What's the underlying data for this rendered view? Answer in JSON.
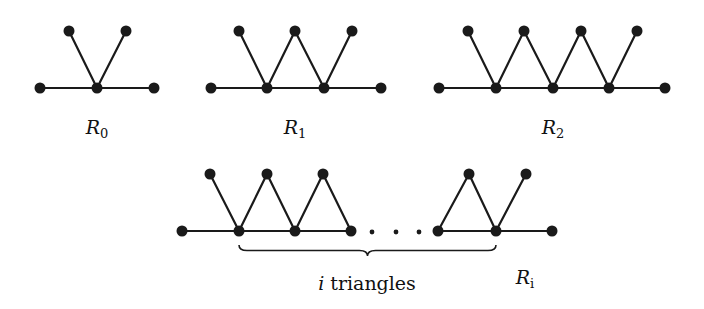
{
  "figure": {
    "graphs": [
      {
        "id": "R0",
        "label": "R",
        "subscript": "0",
        "label_pos": [
          97,
          134
        ],
        "top_nodes": [
          [
            69,
            31
          ],
          [
            126,
            31
          ]
        ],
        "bottom_nodes": [
          [
            40,
            88
          ],
          [
            97,
            88
          ],
          [
            154,
            88
          ]
        ],
        "edges": [
          [
            [
              40,
              88
            ],
            [
              154,
              88
            ]
          ],
          [
            [
              69,
              31
            ],
            [
              97,
              88
            ]
          ],
          [
            [
              126,
              31
            ],
            [
              97,
              88
            ]
          ]
        ]
      },
      {
        "id": "R1",
        "label": "R",
        "subscript": "1",
        "label_pos": [
          295,
          134
        ],
        "top_nodes": [
          [
            239,
            31
          ],
          [
            295,
            31
          ],
          [
            352,
            31
          ]
        ],
        "bottom_nodes": [
          [
            211,
            88
          ],
          [
            267,
            88
          ],
          [
            324,
            88
          ],
          [
            381,
            88
          ]
        ],
        "edges": [
          [
            [
              211,
              88
            ],
            [
              381,
              88
            ]
          ],
          [
            [
              239,
              31
            ],
            [
              267,
              88
            ]
          ],
          [
            [
              267,
              88
            ],
            [
              295,
              31
            ]
          ],
          [
            [
              295,
              31
            ],
            [
              324,
              88
            ]
          ],
          [
            [
              324,
              88
            ],
            [
              352,
              31
            ]
          ]
        ]
      },
      {
        "id": "R2",
        "label": "R",
        "subscript": "2",
        "label_pos": [
          553,
          134
        ],
        "top_nodes": [
          [
            468,
            31
          ],
          [
            524,
            31
          ],
          [
            581,
            31
          ],
          [
            637,
            31
          ]
        ],
        "bottom_nodes": [
          [
            439,
            88
          ],
          [
            496,
            88
          ],
          [
            553,
            88
          ],
          [
            609,
            88
          ],
          [
            665,
            88
          ]
        ],
        "edges": [
          [
            [
              439,
              88
            ],
            [
              665,
              88
            ]
          ],
          [
            [
              468,
              31
            ],
            [
              496,
              88
            ]
          ],
          [
            [
              496,
              88
            ],
            [
              524,
              31
            ]
          ],
          [
            [
              524,
              31
            ],
            [
              553,
              88
            ]
          ],
          [
            [
              553,
              88
            ],
            [
              581,
              31
            ]
          ],
          [
            [
              581,
              31
            ],
            [
              609,
              88
            ]
          ],
          [
            [
              609,
              88
            ],
            [
              637,
              31
            ]
          ]
        ]
      },
      {
        "id": "Ri",
        "label": "R",
        "subscript": "i",
        "label_pos": [
          525,
          284
        ],
        "top_nodes": [
          [
            210,
            174
          ],
          [
            267,
            174
          ],
          [
            323,
            174
          ],
          [
            469,
            174
          ],
          [
            526,
            174
          ]
        ],
        "bottom_nodes": [
          [
            182,
            231
          ],
          [
            239,
            231
          ],
          [
            295,
            231
          ],
          [
            351,
            231
          ],
          [
            438,
            231
          ],
          [
            496,
            231
          ],
          [
            552,
            231
          ]
        ],
        "edges": [
          [
            [
              182,
              231
            ],
            [
              351,
              231
            ]
          ],
          [
            [
              438,
              231
            ],
            [
              552,
              231
            ]
          ],
          [
            [
              210,
              174
            ],
            [
              239,
              231
            ]
          ],
          [
            [
              239,
              231
            ],
            [
              267,
              174
            ]
          ],
          [
            [
              267,
              174
            ],
            [
              295,
              231
            ]
          ],
          [
            [
              295,
              231
            ],
            [
              323,
              174
            ]
          ],
          [
            [
              323,
              174
            ],
            [
              351,
              231
            ]
          ],
          [
            [
              438,
              231
            ],
            [
              469,
              174
            ]
          ],
          [
            [
              469,
              174
            ],
            [
              496,
              231
            ]
          ],
          [
            [
              496,
              231
            ],
            [
              526,
              174
            ]
          ]
        ],
        "ellipsis_dots": [
          [
            372,
            232
          ],
          [
            396,
            232
          ],
          [
            419,
            232
          ]
        ],
        "brace": {
          "x1": 239,
          "x2": 496,
          "y": 245,
          "depth": 11
        },
        "brace_label": {
          "var": "i",
          "text": " triangles",
          "pos": [
            367,
            290
          ]
        }
      }
    ]
  }
}
